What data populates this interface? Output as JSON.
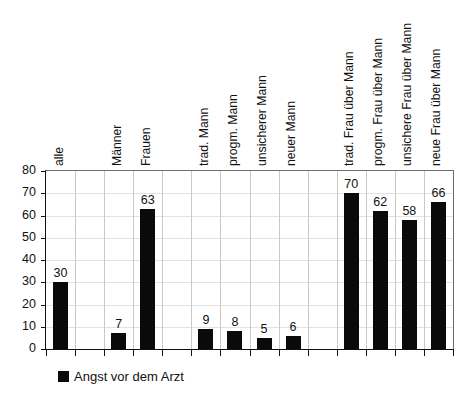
{
  "chart_data": {
    "type": "bar",
    "title": "",
    "xlabel": "",
    "ylabel": "",
    "ylim": [
      0,
      80
    ],
    "ytick_step": 10,
    "yticks": [
      0,
      10,
      20,
      30,
      40,
      50,
      60,
      70,
      80
    ],
    "grid": true,
    "legend_position": "bottom-left",
    "legend": [
      "Angst vor dem Arzt"
    ],
    "bar_color": "#0a0a0a",
    "categories": [
      "alle",
      "",
      "Männer",
      "Frauen",
      "",
      "trad. Mann",
      "progm. Mann",
      "unsicherer Mann",
      "neuer Mann",
      "",
      "trad. Frau über Mann",
      "progm. Frau über Mann",
      "unsichere Frau über Mann",
      "neue Frau über Mann"
    ],
    "values": [
      30,
      null,
      7,
      63,
      null,
      9,
      8,
      5,
      6,
      null,
      70,
      62,
      58,
      66
    ],
    "series": [
      {
        "name": "Angst vor dem Arzt",
        "values": [
          30,
          null,
          7,
          63,
          null,
          9,
          8,
          5,
          6,
          null,
          70,
          62,
          58,
          66
        ]
      }
    ]
  },
  "legend": {
    "items": [
      {
        "label": "Angst vor dem Arzt",
        "color": "#0a0a0a"
      }
    ]
  },
  "title_remnant": "—"
}
